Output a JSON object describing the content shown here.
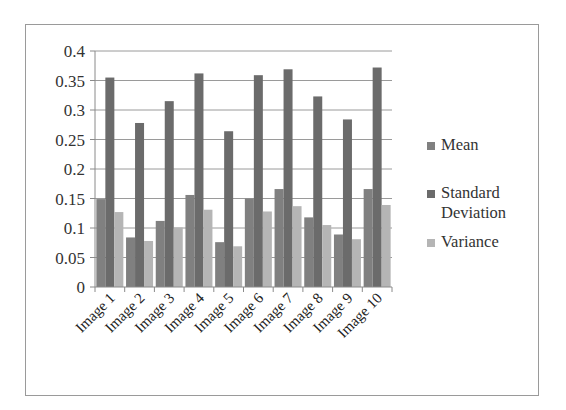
{
  "chart_data": {
    "type": "bar",
    "title": "",
    "xlabel": "",
    "ylabel": "",
    "categories": [
      "Image 1",
      "Image 2",
      "Image 3",
      "Image 4",
      "Image 5",
      "Image 6",
      "Image 7",
      "Image 8",
      "Image 9",
      "Image 10"
    ],
    "series": [
      {
        "name": "Mean",
        "color": "#808080",
        "values": [
          0.149,
          0.084,
          0.112,
          0.156,
          0.076,
          0.15,
          0.166,
          0.118,
          0.089,
          0.166
        ]
      },
      {
        "name": "Standard Deviation",
        "color": "#6b6b6b",
        "values": [
          0.355,
          0.278,
          0.315,
          0.362,
          0.264,
          0.359,
          0.369,
          0.323,
          0.284,
          0.372
        ]
      },
      {
        "name": "Variance",
        "color": "#b5b5b5",
        "values": [
          0.127,
          0.078,
          0.101,
          0.131,
          0.069,
          0.128,
          0.137,
          0.105,
          0.081,
          0.139
        ]
      }
    ],
    "ylim": [
      0,
      0.4
    ],
    "yticks": [
      "0",
      "0.05",
      "0.1",
      "0.15",
      "0.2",
      "0.25",
      "0.3",
      "0.35",
      "0.4"
    ],
    "grid": true,
    "legend_position": "right",
    "xtick_rotation": -45
  },
  "legend": {
    "items": [
      {
        "label": "Mean"
      },
      {
        "label": "Standard Deviation"
      },
      {
        "label": "Variance"
      }
    ]
  }
}
